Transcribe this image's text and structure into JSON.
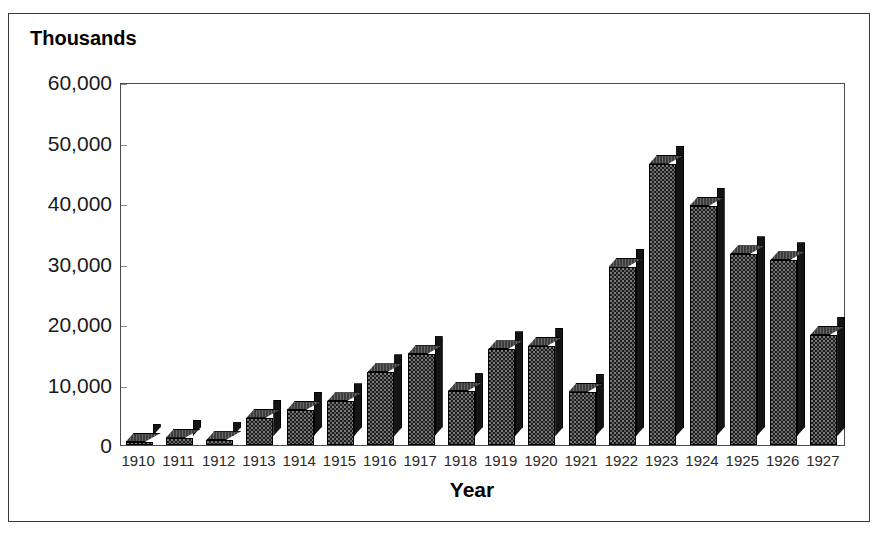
{
  "figure": {
    "background_color": "#ffffff",
    "frame_color": "#3a3a3a",
    "bar_color": "#1c1c1c",
    "bar_top_color": "#3d3d3d"
  },
  "chart_data": {
    "type": "bar",
    "title": "Thousands",
    "xlabel": "Year",
    "ylabel": "Thousands",
    "grid": false,
    "legend": null,
    "ylim": [
      0,
      60000
    ],
    "ytick_labels": [
      "60,000",
      "50,000",
      "40,000",
      "30,000",
      "20,000",
      "10,000",
      "0"
    ],
    "ytick_values": [
      60000,
      50000,
      40000,
      30000,
      20000,
      10000,
      0
    ],
    "categories": [
      "1910",
      "1911",
      "1912",
      "1913",
      "1914",
      "1915",
      "1916",
      "1917",
      "1918",
      "1919",
      "1920",
      "1921",
      "1922",
      "1923",
      "1924",
      "1925",
      "1926",
      "1927"
    ],
    "values": [
      400,
      1200,
      800,
      4500,
      5800,
      7200,
      12000,
      15000,
      8900,
      15800,
      16400,
      8800,
      29500,
      46500,
      39500,
      31500,
      30500,
      18200
    ],
    "style": "3d-bar"
  }
}
